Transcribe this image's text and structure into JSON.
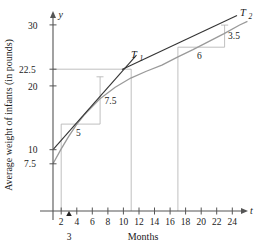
{
  "figure": {
    "y_axis_title": "Average weight of infants (in pounds)",
    "x_axis_title": "Months",
    "x_axis_name": "t",
    "y_axis_name": "y"
  },
  "chart_data": {
    "type": "line",
    "title": "",
    "xlabel": "Months",
    "ylabel": "Average weight of infants (in pounds)",
    "xlim": [
      0,
      26
    ],
    "ylim": [
      0,
      33
    ],
    "grid": false,
    "legend": "none",
    "x_ticks": [
      2,
      4,
      6,
      8,
      10,
      12,
      14,
      16,
      18,
      20,
      22,
      24
    ],
    "x_tick_labels": [
      "2",
      "4",
      "6",
      "8",
      "10",
      "12",
      "14",
      "16",
      "18",
      "20",
      "22",
      "24"
    ],
    "y_ticks": [
      7.5,
      10,
      20,
      22.5,
      30
    ],
    "y_tick_labels": [
      "7.5",
      "10",
      "20",
      "22.5",
      "30"
    ],
    "special_x_marker": {
      "value": 3,
      "label": "3"
    },
    "series": [
      {
        "name": "average weight curve",
        "color": "#9a9a9a",
        "x": [
          0,
          1,
          2,
          3,
          4,
          6,
          8,
          10,
          12,
          14,
          16,
          18,
          20,
          22,
          24,
          25
        ],
        "y": [
          7.5,
          9.8,
          11.9,
          13.8,
          15.4,
          18.0,
          19.9,
          21.4,
          22.5,
          23.5,
          24.8,
          26.0,
          27.3,
          28.6,
          30.0,
          30.6
        ]
      }
    ],
    "tangents": [
      {
        "name": "T_1",
        "label": "T",
        "subscript": "1",
        "tangent_point": {
          "t": 3,
          "y": 13.8
        },
        "slope": 1.5,
        "rise_label": "7.5",
        "run_label": "5",
        "rise": 7.5,
        "run": 5
      },
      {
        "name": "T_2",
        "label": "T",
        "subscript": "2",
        "tangent_point": {
          "t": 18,
          "y": 26.0
        },
        "slope": 0.5833,
        "rise_label": "3.5",
        "run_label": "6",
        "rise": 3.5,
        "run": 6
      }
    ],
    "guide_lines": [
      {
        "type": "vertical",
        "at_x": 3,
        "from_y": 0,
        "to_y": 13.8
      },
      {
        "type": "vertical",
        "at_x": 12,
        "from_y": 0,
        "to_y": 22.5
      },
      {
        "type": "vertical",
        "at_x": 18,
        "from_y": 0,
        "to_y": 26.0
      },
      {
        "type": "horizontal",
        "at_y": 22.5,
        "from_x": 0,
        "to_x": 12
      }
    ]
  }
}
